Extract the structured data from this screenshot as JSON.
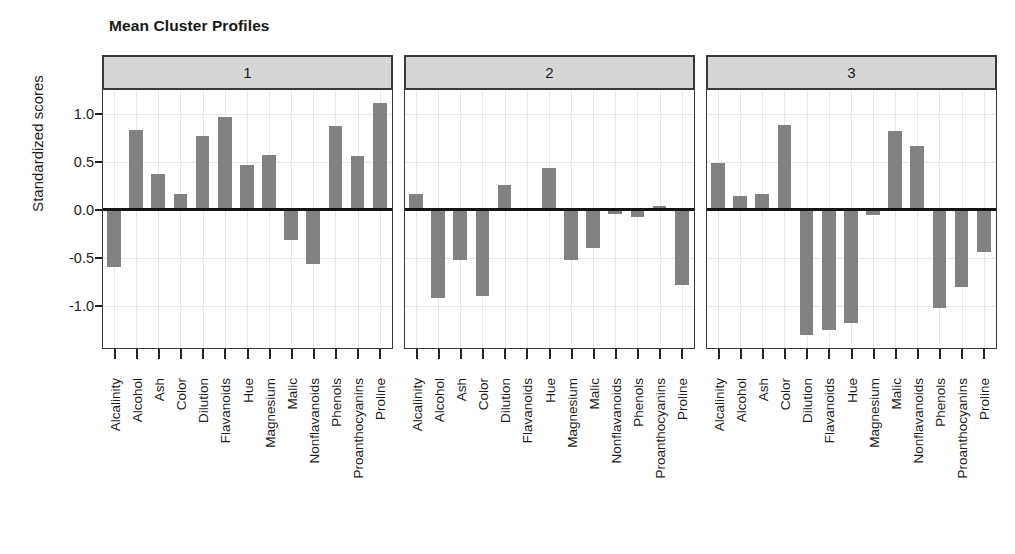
{
  "title": "Mean Cluster Profiles",
  "axis": {
    "ylabel": "Standardized scores",
    "yticks": [
      "1.0",
      "0.5",
      "0.0",
      "-0.5",
      "-1.0"
    ]
  },
  "panel_labels": [
    "1",
    "2",
    "3"
  ],
  "colors": {
    "bar": "#818181",
    "strip_background": "#d6d6d6",
    "panel_border": "#3a3a3a",
    "gridline": "#e6e6e6",
    "zeroline": "#141414",
    "text": "#1b1b1b"
  },
  "chart_data": {
    "type": "bar",
    "title": "Mean Cluster Profiles",
    "xlabel": "",
    "ylabel": "Standardized scores",
    "ylim": [
      -1.45,
      1.25
    ],
    "yticks": [
      1.0,
      0.5,
      0.0,
      -0.5,
      -1.0
    ],
    "grid": true,
    "legend": "none",
    "panel_layout": "3 horizontal panels (trellis), one per cluster",
    "categories": [
      "Alcalinity",
      "Alcohol",
      "Ash",
      "Color",
      "Dilution",
      "Flavanoids",
      "Hue",
      "Magnesium",
      "Malic",
      "Nonflavanoids",
      "Phenols",
      "Proanthocyanins",
      "Proline"
    ],
    "series": [
      {
        "name": "1",
        "values": [
          -0.6,
          0.83,
          0.37,
          0.17,
          0.77,
          0.97,
          0.47,
          0.57,
          -0.31,
          -0.56,
          0.87,
          0.56,
          1.11
        ]
      },
      {
        "name": "2",
        "values": [
          0.17,
          -0.92,
          -0.52,
          -0.9,
          0.26,
          0.0,
          0.44,
          -0.52,
          -0.4,
          -0.04,
          -0.07,
          0.04,
          -0.78
        ]
      },
      {
        "name": "3",
        "values": [
          0.49,
          0.14,
          0.17,
          0.89,
          -1.3,
          -1.25,
          -1.18,
          -0.05,
          0.82,
          0.67,
          -1.02,
          -0.8,
          -0.44
        ]
      }
    ]
  }
}
